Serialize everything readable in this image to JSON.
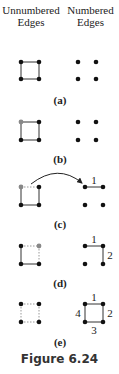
{
  "headers": {
    "left": [
      "Unnumbered",
      "Edges"
    ],
    "right": [
      "Numbered",
      "Edges"
    ]
  },
  "panels": [
    {
      "label": "(a)",
      "unnumbered": {
        "highlight": "none",
        "solid": [
          "top",
          "right",
          "bottom",
          "left"
        ],
        "dotted": []
      },
      "numbered": {
        "edges": []
      }
    },
    {
      "label": "(b)",
      "unnumbered": {
        "highlight": "top-left",
        "solid": [
          "top",
          "right",
          "bottom",
          "left"
        ],
        "dotted": []
      },
      "numbered": {
        "edges": []
      }
    },
    {
      "label": "(c)",
      "unnumbered": {
        "highlight": "top-left",
        "solid": [
          "right",
          "bottom",
          "left"
        ],
        "dotted": [
          "top"
        ]
      },
      "numbered": {
        "edges": [
          {
            "side": "top",
            "number": "1"
          }
        ]
      },
      "arrow": "top edge moved to numbered side"
    },
    {
      "label": "(d)",
      "unnumbered": {
        "highlight": "top-right",
        "solid": [
          "bottom",
          "left"
        ],
        "dotted": [
          "top",
          "right"
        ]
      },
      "numbered": {
        "edges": [
          {
            "side": "top",
            "number": "1"
          },
          {
            "side": "right",
            "number": "2"
          }
        ]
      }
    },
    {
      "label": "(e)",
      "unnumbered": {
        "highlight": "none",
        "solid": [],
        "dotted": [
          "top",
          "right",
          "bottom",
          "left"
        ]
      },
      "numbered": {
        "edges": [
          {
            "side": "top",
            "number": "1"
          },
          {
            "side": "right",
            "number": "2"
          },
          {
            "side": "bottom",
            "number": "3"
          },
          {
            "side": "left",
            "number": "4"
          }
        ]
      }
    }
  ],
  "caption": "Figure 6.24",
  "colors": {
    "node": "#111111",
    "highlight_node": "#888888",
    "edge": "#333333"
  }
}
